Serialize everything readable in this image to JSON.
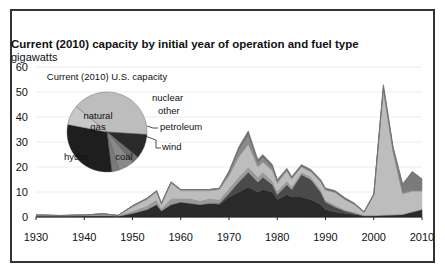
{
  "title": "Current (2010) capacity by initial year of operation and fuel type",
  "unit": "gigawatts",
  "colors": {
    "coal": "#2a2a2a",
    "nuclear": "#4a4a4a",
    "hydro": "#9a9a9a",
    "other": "#6e6e6e",
    "natural_gas": "#bdbdbd",
    "petroleum": "#8a8a8a",
    "wind": "#7a7a7a"
  },
  "chart_data": [
    {
      "type": "area",
      "title": "Current (2010) capacity by initial year of operation and fuel type",
      "ylabel": "gigawatts",
      "xlabel": "",
      "x_ticks": [
        "1930",
        "1940",
        "1950",
        "1960",
        "1970",
        "1980",
        "1990",
        "2000",
        "2010"
      ],
      "y_ticks": [
        "0",
        "10",
        "20",
        "30",
        "40",
        "50",
        "60"
      ],
      "xlim": [
        1930,
        2010
      ],
      "ylim": [
        0,
        60
      ],
      "grid": true,
      "stacked": true,
      "x": [
        1930,
        1935,
        1940,
        1944,
        1947,
        1950,
        1953,
        1955,
        1956,
        1958,
        1960,
        1962,
        1964,
        1966,
        1968,
        1970,
        1972,
        1974,
        1976,
        1977,
        1979,
        1980,
        1982,
        1983,
        1985,
        1987,
        1989,
        1990,
        1992,
        1994,
        1996,
        1998,
        2000,
        2002,
        2004,
        2006,
        2008,
        2010
      ],
      "series": [
        {
          "name": "coal",
          "values": [
            0.3,
            0.3,
            0.4,
            0.5,
            0.3,
            1.5,
            3,
            5,
            2.5,
            5,
            6,
            5.5,
            5,
            5.5,
            5,
            8,
            10,
            12,
            10,
            11,
            10,
            7,
            9,
            8,
            8,
            7,
            5,
            3,
            2,
            1.5,
            1,
            0.5,
            0.5,
            0.7,
            0.8,
            1,
            2,
            3
          ]
        },
        {
          "name": "nuclear",
          "values": [
            0,
            0,
            0,
            0,
            0,
            0,
            0,
            0,
            0,
            0,
            0,
            0,
            0,
            0,
            0.5,
            1.5,
            4,
            6,
            4,
            5,
            3,
            2,
            4,
            3,
            9,
            8,
            5,
            3,
            2,
            1,
            0.5,
            0,
            0,
            0,
            0,
            0,
            0,
            0
          ]
        },
        {
          "name": "hydro",
          "values": [
            0.5,
            0.3,
            0.4,
            0.8,
            0.3,
            1,
            1.5,
            2,
            1,
            2.5,
            1.5,
            2,
            1.5,
            2,
            1.5,
            2,
            2,
            2,
            2,
            2,
            1.5,
            1.5,
            1.5,
            1.2,
            1,
            1,
            1,
            0.8,
            0.8,
            0.5,
            0.5,
            0.3,
            0.3,
            0.3,
            0.3,
            0.3,
            0.3,
            0.3
          ]
        },
        {
          "name": "natural_gas",
          "values": [
            0,
            0,
            0,
            0,
            0,
            1.5,
            2.5,
            3,
            1.5,
            6,
            3,
            3,
            4,
            3,
            4,
            5,
            8,
            9,
            4,
            4,
            4,
            3,
            4,
            3,
            2,
            2,
            3,
            4,
            5,
            4,
            3,
            1,
            8,
            50,
            25,
            8,
            8,
            7
          ]
        },
        {
          "name": "petroleum",
          "values": [
            0,
            0,
            0,
            0,
            0,
            0.5,
            0.5,
            0.5,
            0.5,
            0.5,
            0.5,
            0.5,
            0.5,
            0.5,
            0.5,
            1.5,
            3,
            4,
            2,
            2,
            1.5,
            1,
            0.5,
            0.5,
            0.5,
            0.5,
            0.5,
            0.3,
            0.3,
            0.3,
            0.3,
            0.2,
            0.2,
            0.5,
            0.5,
            0.5,
            0.5,
            0.5
          ]
        },
        {
          "name": "wind",
          "values": [
            0,
            0,
            0,
            0,
            0,
            0,
            0,
            0,
            0,
            0,
            0,
            0,
            0,
            0,
            0,
            0,
            0,
            0,
            0,
            0,
            0,
            0,
            0,
            0,
            0,
            0,
            0,
            0,
            0,
            0,
            0,
            0,
            0,
            1,
            1,
            3,
            7,
            4
          ]
        },
        {
          "name": "other",
          "values": [
            0,
            0,
            0,
            0,
            0,
            0,
            0,
            0,
            0,
            0,
            0,
            0,
            0,
            0,
            0,
            0.5,
            1,
            1.5,
            1,
            1,
            1,
            0.5,
            0.5,
            0.5,
            0.5,
            0.5,
            0.5,
            0.5,
            0.5,
            0.5,
            0.3,
            0.2,
            0.3,
            0.5,
            0.5,
            0.5,
            0.5,
            0.5
          ]
        }
      ]
    },
    {
      "type": "pie",
      "title": "Current (2010) U.S. capacity",
      "categories": [
        "natural gas",
        "nuclear",
        "other",
        "petroleum",
        "wind",
        "coal",
        "hydro"
      ],
      "values": [
        40,
        10,
        3,
        6,
        3,
        30,
        8
      ]
    }
  ]
}
